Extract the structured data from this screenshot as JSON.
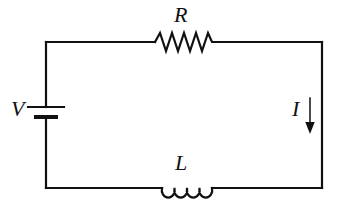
{
  "diagram": {
    "type": "circuit-schematic",
    "background_color": "#ffffff",
    "line_color": "#111111",
    "line_width": 2.2,
    "labels": {
      "resistor": "R",
      "inductor": "L",
      "source": "V",
      "current": "I"
    },
    "components": [
      {
        "id": "voltage-source",
        "kind": "battery",
        "label": "V",
        "position": "left-branch",
        "cx": 56,
        "cy": 112,
        "long_plate_half_width": 20,
        "short_plate_half_width": 12,
        "plate_gap": 10
      },
      {
        "id": "resistor",
        "kind": "resistor-zigzag",
        "label": "R",
        "position": "top-branch",
        "x_start": 155,
        "x_end": 215,
        "y": 42,
        "amplitude": 9,
        "peaks": 5
      },
      {
        "id": "inductor",
        "kind": "inductor-coil",
        "label": "L",
        "position": "bottom-branch",
        "x_start": 162,
        "x_end": 212,
        "y": 188,
        "loops": 4,
        "loop_radius": 7
      },
      {
        "id": "current-arrow",
        "kind": "arrow-down",
        "label": "I",
        "position": "right-branch",
        "x": 310,
        "y_start": 98,
        "y_end": 134
      }
    ],
    "wire_rect": {
      "left": 46,
      "right": 322,
      "top": 42,
      "bottom": 188
    }
  }
}
